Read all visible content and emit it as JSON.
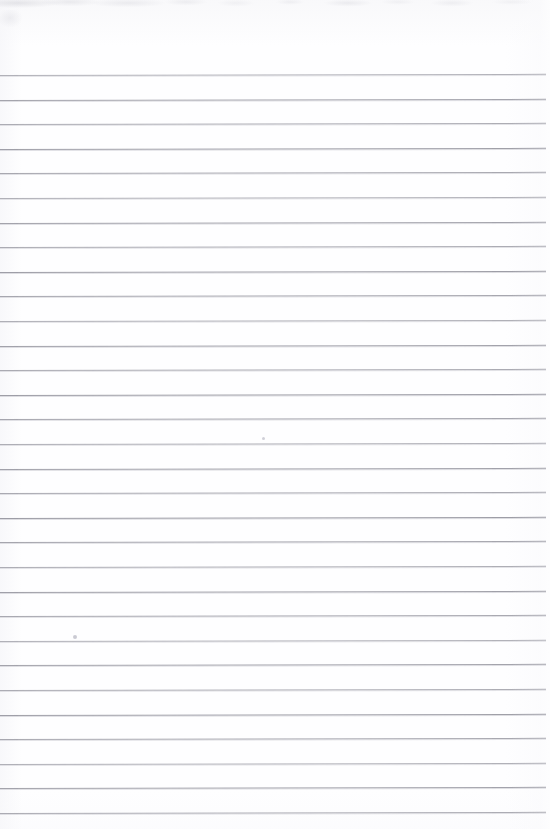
{
  "document": {
    "kind": "scanned-ruled-paper",
    "title": "Blank lined notebook page",
    "content_text": "",
    "page_width": 550,
    "page_height": 829,
    "background_color": "#fefeff",
    "rule_color": "#9d9da6",
    "rule_shadow_color": "#b0b0ba",
    "has_text": false,
    "has_margin_rule": false
  },
  "ruling": {
    "line_count": 31,
    "first_line_y": 75,
    "line_spacing": 24.6,
    "line_start_x": 0,
    "line_end_x": 546,
    "line_thickness": 1,
    "skew_degrees": -0.12,
    "description": "Evenly spaced horizontal grey ruled lines spanning the full page width"
  },
  "artifacts": {
    "top_edge_smudge": "faint grey scanner blotching along the top edge",
    "specks": [
      {
        "name": "speck-upper",
        "x": 263,
        "y": 438,
        "size": 3,
        "color": "#c9c9d2"
      },
      {
        "name": "speck-lower",
        "x": 75,
        "y": 637,
        "size": 4,
        "color": "#c2c2cc"
      }
    ]
  }
}
